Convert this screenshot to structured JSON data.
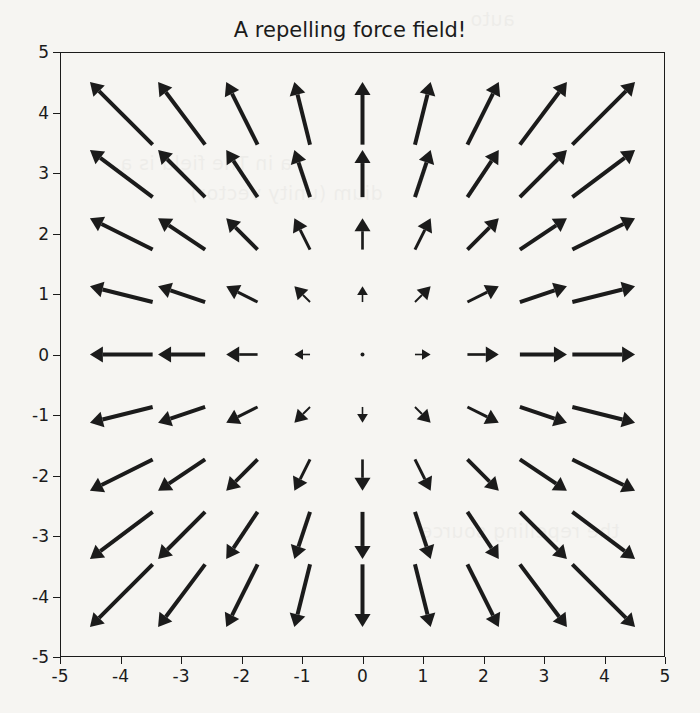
{
  "figure": {
    "title": "A repelling force field!",
    "background_color": "#f6f5f2",
    "foreground_color": "#1b1b1b"
  },
  "axes": {
    "x_tick_labels": [
      "-5",
      "-4",
      "-3",
      "-2",
      "-1",
      "0",
      "1",
      "2",
      "3",
      "4",
      "5"
    ],
    "y_tick_labels": [
      "-5",
      "-4",
      "-3",
      "-2",
      "-1",
      "0",
      "1",
      "2",
      "3",
      "4",
      "5"
    ],
    "xlabel": "",
    "ylabel": ""
  },
  "page_bleed": {
    "line1": "auto",
    "line2": "a in The field is a",
    "line3": "dium (unity vector)",
    "line4": "the repelling source"
  },
  "chart_data": {
    "type": "quiver",
    "title": "A repelling force field!",
    "xlabel": "",
    "ylabel": "",
    "xlim": [
      -5,
      5
    ],
    "ylim": [
      -5,
      5
    ],
    "xticks": [
      -5,
      -4,
      -3,
      -2,
      -1,
      0,
      1,
      2,
      3,
      4,
      5
    ],
    "yticks": [
      -5,
      -4,
      -3,
      -2,
      -1,
      0,
      1,
      2,
      3,
      4,
      5
    ],
    "grid": false,
    "legend": null,
    "field_description": "Radially outward (repelling) vector field. At each grid point (x,y) the vector is (u,v) = (x,y); magnitude grows linearly with distance from the origin, so arrows vanish at (0,0) and are longest at the corners.",
    "grid_x": [
      -4,
      -3,
      -2,
      -1,
      0,
      1,
      2,
      3,
      4
    ],
    "grid_y": [
      -4,
      -3,
      -2,
      -1,
      0,
      1,
      2,
      3,
      4
    ],
    "arrow_scale": 0.26,
    "arrow_color": "#1b1b1b",
    "vectors": [
      {
        "x": -4,
        "y": 4,
        "u": -4,
        "v": 4
      },
      {
        "x": -3,
        "y": 4,
        "u": -3,
        "v": 4
      },
      {
        "x": -2,
        "y": 4,
        "u": -2,
        "v": 4
      },
      {
        "x": -1,
        "y": 4,
        "u": -1,
        "v": 4
      },
      {
        "x": 0,
        "y": 4,
        "u": 0,
        "v": 4
      },
      {
        "x": 1,
        "y": 4,
        "u": 1,
        "v": 4
      },
      {
        "x": 2,
        "y": 4,
        "u": 2,
        "v": 4
      },
      {
        "x": 3,
        "y": 4,
        "u": 3,
        "v": 4
      },
      {
        "x": 4,
        "y": 4,
        "u": 4,
        "v": 4
      },
      {
        "x": -4,
        "y": 3,
        "u": -4,
        "v": 3
      },
      {
        "x": -3,
        "y": 3,
        "u": -3,
        "v": 3
      },
      {
        "x": -2,
        "y": 3,
        "u": -2,
        "v": 3
      },
      {
        "x": -1,
        "y": 3,
        "u": -1,
        "v": 3
      },
      {
        "x": 0,
        "y": 3,
        "u": 0,
        "v": 3
      },
      {
        "x": 1,
        "y": 3,
        "u": 1,
        "v": 3
      },
      {
        "x": 2,
        "y": 3,
        "u": 2,
        "v": 3
      },
      {
        "x": 3,
        "y": 3,
        "u": 3,
        "v": 3
      },
      {
        "x": 4,
        "y": 3,
        "u": 4,
        "v": 3
      },
      {
        "x": -4,
        "y": 2,
        "u": -4,
        "v": 2
      },
      {
        "x": -3,
        "y": 2,
        "u": -3,
        "v": 2
      },
      {
        "x": -2,
        "y": 2,
        "u": -2,
        "v": 2
      },
      {
        "x": -1,
        "y": 2,
        "u": -1,
        "v": 2
      },
      {
        "x": 0,
        "y": 2,
        "u": 0,
        "v": 2
      },
      {
        "x": 1,
        "y": 2,
        "u": 1,
        "v": 2
      },
      {
        "x": 2,
        "y": 2,
        "u": 2,
        "v": 2
      },
      {
        "x": 3,
        "y": 2,
        "u": 3,
        "v": 2
      },
      {
        "x": 4,
        "y": 2,
        "u": 4,
        "v": 2
      },
      {
        "x": -4,
        "y": 1,
        "u": -4,
        "v": 1
      },
      {
        "x": -3,
        "y": 1,
        "u": -3,
        "v": 1
      },
      {
        "x": -2,
        "y": 1,
        "u": -2,
        "v": 1
      },
      {
        "x": -1,
        "y": 1,
        "u": -1,
        "v": 1
      },
      {
        "x": 0,
        "y": 1,
        "u": 0,
        "v": 1
      },
      {
        "x": 1,
        "y": 1,
        "u": 1,
        "v": 1
      },
      {
        "x": 2,
        "y": 1,
        "u": 2,
        "v": 1
      },
      {
        "x": 3,
        "y": 1,
        "u": 3,
        "v": 1
      },
      {
        "x": 4,
        "y": 1,
        "u": 4,
        "v": 1
      },
      {
        "x": -4,
        "y": 0,
        "u": -4,
        "v": 0
      },
      {
        "x": -3,
        "y": 0,
        "u": -3,
        "v": 0
      },
      {
        "x": -2,
        "y": 0,
        "u": -2,
        "v": 0
      },
      {
        "x": -1,
        "y": 0,
        "u": -1,
        "v": 0
      },
      {
        "x": 0,
        "y": 0,
        "u": 0,
        "v": 0
      },
      {
        "x": 1,
        "y": 0,
        "u": 1,
        "v": 0
      },
      {
        "x": 2,
        "y": 0,
        "u": 2,
        "v": 0
      },
      {
        "x": 3,
        "y": 0,
        "u": 3,
        "v": 0
      },
      {
        "x": 4,
        "y": 0,
        "u": 4,
        "v": 0
      },
      {
        "x": -4,
        "y": -1,
        "u": -4,
        "v": -1
      },
      {
        "x": -3,
        "y": -1,
        "u": -3,
        "v": -1
      },
      {
        "x": -2,
        "y": -1,
        "u": -2,
        "v": -1
      },
      {
        "x": -1,
        "y": -1,
        "u": -1,
        "v": -1
      },
      {
        "x": 0,
        "y": -1,
        "u": 0,
        "v": -1
      },
      {
        "x": 1,
        "y": -1,
        "u": 1,
        "v": -1
      },
      {
        "x": 2,
        "y": -1,
        "u": 2,
        "v": -1
      },
      {
        "x": 3,
        "y": -1,
        "u": 3,
        "v": -1
      },
      {
        "x": 4,
        "y": -1,
        "u": 4,
        "v": -1
      },
      {
        "x": -4,
        "y": -2,
        "u": -4,
        "v": -2
      },
      {
        "x": -3,
        "y": -2,
        "u": -3,
        "v": -2
      },
      {
        "x": -2,
        "y": -2,
        "u": -2,
        "v": -2
      },
      {
        "x": -1,
        "y": -2,
        "u": -1,
        "v": -2
      },
      {
        "x": 0,
        "y": -2,
        "u": 0,
        "v": -2
      },
      {
        "x": 1,
        "y": -2,
        "u": 1,
        "v": -2
      },
      {
        "x": 2,
        "y": -2,
        "u": 2,
        "v": -2
      },
      {
        "x": 3,
        "y": -2,
        "u": 3,
        "v": -2
      },
      {
        "x": 4,
        "y": -2,
        "u": 4,
        "v": -2
      },
      {
        "x": -4,
        "y": -3,
        "u": -4,
        "v": -3
      },
      {
        "x": -3,
        "y": -3,
        "u": -3,
        "v": -3
      },
      {
        "x": -2,
        "y": -3,
        "u": -2,
        "v": -3
      },
      {
        "x": -1,
        "y": -3,
        "u": -1,
        "v": -3
      },
      {
        "x": 0,
        "y": -3,
        "u": 0,
        "v": -3
      },
      {
        "x": 1,
        "y": -3,
        "u": 1,
        "v": -3
      },
      {
        "x": 2,
        "y": -3,
        "u": 2,
        "v": -3
      },
      {
        "x": 3,
        "y": -3,
        "u": 3,
        "v": -3
      },
      {
        "x": 4,
        "y": -3,
        "u": 4,
        "v": -3
      },
      {
        "x": -4,
        "y": -4,
        "u": -4,
        "v": -4
      },
      {
        "x": -3,
        "y": -4,
        "u": -3,
        "v": -4
      },
      {
        "x": -2,
        "y": -4,
        "u": -2,
        "v": -4
      },
      {
        "x": -1,
        "y": -4,
        "u": -1,
        "v": -4
      },
      {
        "x": 0,
        "y": -4,
        "u": 0,
        "v": -4
      },
      {
        "x": 1,
        "y": -4,
        "u": 1,
        "v": -4
      },
      {
        "x": 2,
        "y": -4,
        "u": 2,
        "v": -4
      },
      {
        "x": 3,
        "y": -4,
        "u": 3,
        "v": -4
      },
      {
        "x": 4,
        "y": -4,
        "u": 4,
        "v": -4
      }
    ]
  }
}
